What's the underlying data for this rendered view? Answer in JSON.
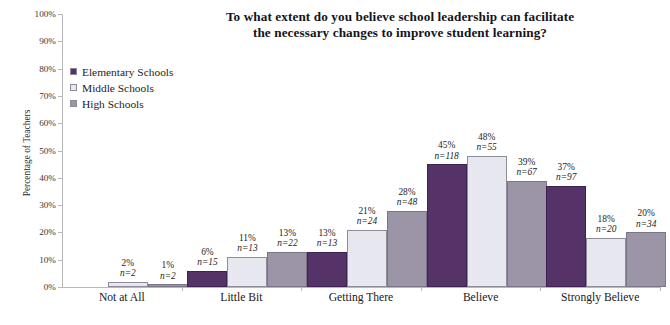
{
  "chart_data": {
    "type": "bar",
    "title": "To what extent do you believe school leadership can facilitate the necessary changes to improve student learning?",
    "title_line1": "To what extent do you believe school leadership can facilitate",
    "title_line2": "the necessary changes to improve student learning?",
    "xlabel": "",
    "ylabel": "Percentage of Teachers",
    "ylim": [
      0,
      100
    ],
    "ytick_labels": [
      "100%",
      "90%",
      "80%",
      "70%",
      "60%",
      "50%",
      "40%",
      "30%",
      "20%",
      "10%",
      "0%"
    ],
    "ytick_values": [
      100,
      90,
      80,
      70,
      60,
      50,
      40,
      30,
      20,
      10,
      0
    ],
    "grid": false,
    "legend_position": "upper-left-inside",
    "categories": [
      "Not at All",
      "Little Bit",
      "Getting There",
      "Believe",
      "Strongly Believe"
    ],
    "series": [
      {
        "name": "Elementary Schools",
        "color": "#553268",
        "values": [
          null,
          6,
          13,
          45,
          37
        ],
        "labels": [
          "",
          "6%",
          "13%",
          "45%",
          "37%"
        ],
        "counts": [
          "",
          "n=15",
          "n=13",
          "n=118",
          "n=97"
        ]
      },
      {
        "name": "Middle Schools",
        "color": "#e6e7ef",
        "values": [
          2,
          11,
          21,
          48,
          18
        ],
        "labels": [
          "2%",
          "11%",
          "21%",
          "48%",
          "18%"
        ],
        "counts": [
          "n=2",
          "n=13",
          "n=24",
          "n=55",
          "n=20"
        ]
      },
      {
        "name": "High Schools",
        "color": "#9b95a7",
        "values": [
          1,
          13,
          28,
          39,
          20
        ],
        "labels": [
          "1%",
          "13%",
          "28%",
          "39%",
          "20%"
        ],
        "counts": [
          "n=2",
          "n=22",
          "n=48",
          "n=67",
          "n=34"
        ]
      }
    ]
  }
}
